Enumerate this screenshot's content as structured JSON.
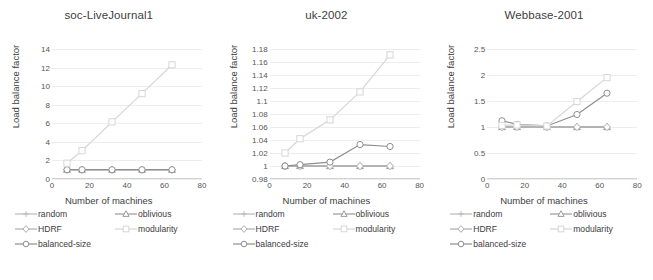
{
  "figure": {
    "xlabel": "Number of machines",
    "ylabel": "Load balance factor",
    "xticks": [
      0,
      20,
      40,
      60,
      80
    ],
    "xlim": [
      0,
      80
    ],
    "grid": true,
    "legend_position": "below-each-panel",
    "series_styles": {
      "random": {
        "color": "#b9b9b9",
        "marker": "cross"
      },
      "oblivious": {
        "color": "#9a9a9a",
        "marker": "triangle"
      },
      "HDRF": {
        "color": "#aeaeae",
        "marker": "diamond"
      },
      "modularity": {
        "color": "#d6d6d6",
        "marker": "square"
      },
      "balanced-size": {
        "color": "#8e8e8e",
        "marker": "circle"
      }
    }
  },
  "legend": {
    "rows": [
      [
        {
          "label": "random",
          "key": "random"
        },
        {
          "label": "oblivious",
          "key": "oblivious"
        }
      ],
      [
        {
          "label": "HDRF",
          "key": "HDRF"
        },
        {
          "label": "modularity",
          "key": "modularity"
        }
      ],
      [
        {
          "label": "balanced-size",
          "key": "balanced-size"
        },
        {
          "label": "",
          "key": ""
        }
      ]
    ]
  },
  "chart_data": [
    {
      "type": "line",
      "title": "soc-LiveJournal1",
      "xlabel": "Number of machines",
      "ylabel": "Load balance factor",
      "x": [
        8,
        16,
        32,
        48,
        64
      ],
      "xlim": [
        0,
        80
      ],
      "ylim": [
        0,
        14
      ],
      "yticks": [
        0,
        2,
        4,
        6,
        8,
        10,
        12,
        14
      ],
      "ytick_labels": [
        "0",
        "2",
        "4",
        "6",
        "8",
        "10",
        "12",
        "14"
      ],
      "series": [
        {
          "name": "random",
          "values": [
            1.0,
            1.0,
            1.0,
            1.0,
            1.0
          ]
        },
        {
          "name": "oblivious",
          "values": [
            1.0,
            1.0,
            1.0,
            1.0,
            1.0
          ]
        },
        {
          "name": "HDRF",
          "values": [
            1.0,
            1.0,
            1.0,
            1.0,
            1.0
          ]
        },
        {
          "name": "modularity",
          "values": [
            1.7,
            3.05,
            6.15,
            9.2,
            12.3
          ]
        },
        {
          "name": "balanced-size",
          "values": [
            1.0,
            1.0,
            1.0,
            1.0,
            1.0
          ]
        }
      ]
    },
    {
      "type": "line",
      "title": "uk-2002",
      "xlabel": "Number of machines",
      "ylabel": "Load balance factor",
      "x": [
        8,
        16,
        32,
        48,
        64
      ],
      "xlim": [
        0,
        80
      ],
      "ylim": [
        0.98,
        1.18
      ],
      "yticks": [
        0.98,
        1.0,
        1.02,
        1.04,
        1.06,
        1.08,
        1.1,
        1.12,
        1.14,
        1.16,
        1.18
      ],
      "ytick_labels": [
        "0.98",
        "1",
        "1.02",
        "1.04",
        "1.06",
        "1.08",
        "1.1",
        "1.12",
        "1.14",
        "1.16",
        "1.18"
      ],
      "series": [
        {
          "name": "random",
          "values": [
            1.0,
            1.0,
            1.0,
            1.0,
            1.0
          ]
        },
        {
          "name": "oblivious",
          "values": [
            1.0,
            1.0,
            1.0,
            1.0,
            1.0
          ]
        },
        {
          "name": "HDRF",
          "values": [
            1.0,
            1.0,
            1.0,
            1.0,
            1.0
          ]
        },
        {
          "name": "modularity",
          "values": [
            1.02,
            1.042,
            1.071,
            1.114,
            1.171
          ]
        },
        {
          "name": "balanced-size",
          "values": [
            1.0,
            1.002,
            1.006,
            1.033,
            1.03
          ]
        }
      ]
    },
    {
      "type": "line",
      "title": "Webbase-2001",
      "xlabel": "Number of machines",
      "ylabel": "Load balance factor",
      "x": [
        8,
        16,
        32,
        48,
        64
      ],
      "xlim": [
        0,
        80
      ],
      "ylim": [
        0,
        2.5
      ],
      "yticks": [
        0,
        0.5,
        1.0,
        1.5,
        2.0,
        2.5
      ],
      "ytick_labels": [
        "0",
        "0.5",
        "1",
        "1.5",
        "2",
        "2.5"
      ],
      "series": [
        {
          "name": "random",
          "values": [
            1.0,
            1.0,
            1.0,
            1.0,
            1.0
          ]
        },
        {
          "name": "oblivious",
          "values": [
            1.0,
            1.0,
            1.0,
            1.0,
            1.0
          ]
        },
        {
          "name": "HDRF",
          "values": [
            1.0,
            1.0,
            1.0,
            1.0,
            1.0
          ]
        },
        {
          "name": "modularity",
          "values": [
            1.03,
            1.04,
            1.02,
            1.49,
            1.95
          ]
        },
        {
          "name": "balanced-size",
          "values": [
            1.12,
            1.05,
            1.02,
            1.24,
            1.65
          ]
        }
      ]
    }
  ]
}
